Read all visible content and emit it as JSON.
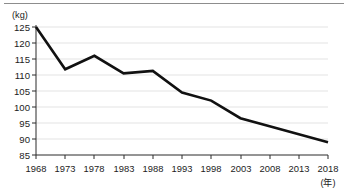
{
  "chart_data": {
    "type": "line",
    "title": "",
    "subtitle": "",
    "xlabel": "(年)",
    "ylabel": "(kg)",
    "x": [
      1968,
      1973,
      1978,
      1983,
      1988,
      1993,
      1998,
      2003,
      2008,
      2013,
      2018
    ],
    "xtick_labels": [
      "1968",
      "1973",
      "1978",
      "1983",
      "1988",
      "1993",
      "1998",
      "2003",
      "2008",
      "2013",
      "2018"
    ],
    "ytick_labels": [
      "125",
      "120",
      "115",
      "110",
      "105",
      "100",
      "95",
      "90",
      "85"
    ],
    "yticks": [
      125,
      120,
      115,
      110,
      105,
      100,
      95,
      90,
      85
    ],
    "xlim": [
      1968,
      2018
    ],
    "ylim": [
      85,
      125
    ],
    "grid": true,
    "grid_axis": "y",
    "legend": false,
    "legend_position": "none",
    "series": [
      {
        "name": "",
        "color": "#111111",
        "values": [
          125.0,
          111.8,
          116.0,
          110.5,
          111.3,
          104.5,
          102.0,
          96.5,
          94.0,
          91.5,
          89.0
        ]
      }
    ]
  },
  "style": {
    "line_color": "#111111",
    "grid_color": "#dcdcdc",
    "axis_color": "#2b2b2b",
    "text_color": "#1c1c1c",
    "background": "#ffffff",
    "rule_color": "#8d8d8d"
  }
}
